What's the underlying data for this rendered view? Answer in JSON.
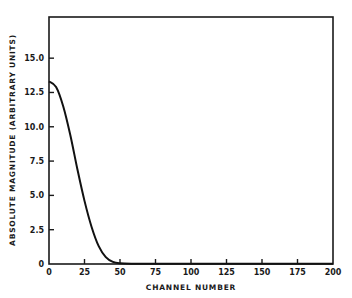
{
  "chart_data": {
    "type": "line",
    "title": "",
    "xlabel": "CHANNEL NUMBER",
    "ylabel": "ABSOLUTE MAGNITUDE (ARBITRARY UNITS)",
    "xlim": [
      0,
      200
    ],
    "ylim": [
      0,
      18
    ],
    "grid": false,
    "legend": null,
    "x_ticks": [
      0,
      25,
      50,
      75,
      100,
      125,
      150,
      175,
      200
    ],
    "x_tick_labels": [
      "0",
      "25",
      "50",
      "75",
      "100",
      "125",
      "150",
      "175",
      "200"
    ],
    "y_ticks": [
      0,
      2.5,
      5.0,
      7.5,
      10.0,
      12.5,
      15.0
    ],
    "y_tick_labels": [
      "0",
      "2.5",
      "5.0",
      "7.5",
      "10.0",
      "12.5",
      "15.0"
    ],
    "series": [
      {
        "name": "magnitude",
        "x": [
          0,
          5,
          10,
          15,
          20,
          25,
          30,
          35,
          40,
          45,
          50,
          60,
          75,
          100,
          125,
          150,
          175,
          200
        ],
        "values": [
          13.3,
          12.9,
          11.5,
          9.4,
          6.9,
          4.6,
          2.7,
          1.3,
          0.5,
          0.15,
          0.05,
          0.02,
          0.01,
          0.01,
          0.01,
          0.01,
          0.01,
          0.01
        ]
      }
    ]
  }
}
